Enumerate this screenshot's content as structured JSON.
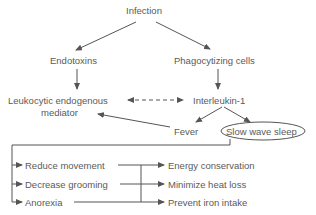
{
  "diagram": {
    "nodes": {
      "infection": "Infection",
      "endotoxins": "Endotoxins",
      "phagocytizing": "Phagocytizing cells",
      "leukocytic_line1": "Leukocytic endogenous",
      "leukocytic_line2": "mediator",
      "interleukin": "Interleukin-1",
      "fever": "Fever",
      "slow_wave_sleep": "Slow wave sleep"
    },
    "behaviors": [
      "Reduce movement",
      "Decrease grooming",
      "Anorexia"
    ],
    "outcomes": [
      "Energy conservation",
      "Minimize heat loss",
      "Prevent iron intake"
    ],
    "colors": {
      "line": "#555555",
      "text": "#5a5a5a"
    }
  }
}
